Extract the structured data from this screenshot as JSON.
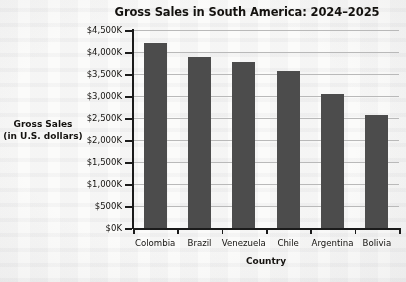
{
  "chart_data": {
    "type": "bar",
    "title": "Gross Sales in South America: 2024–2025",
    "xlabel": "Country",
    "ylabel": "Gross Sales\n(in U.S. dollars)",
    "ylabel_line1": "Gross Sales",
    "ylabel_line2": "(in U.S. dollars)",
    "categories": [
      "Colombia",
      "Brazil",
      "Venezuela",
      "Chile",
      "Argentina",
      "Bolivia"
    ],
    "values": [
      4200,
      3880,
      3770,
      3570,
      3050,
      2560
    ],
    "value_unit": "thousands of U.S. dollars",
    "ylim": [
      0,
      4500
    ],
    "ytick_values": [
      0,
      500,
      1000,
      1500,
      2000,
      2500,
      3000,
      3500,
      4000,
      4500
    ],
    "ytick_labels": [
      "$0K",
      "$500K",
      "$1,000K",
      "$1,500K",
      "$2,000K",
      "$2,500K",
      "$3,000K",
      "$3,500K",
      "$4,000K",
      "$4,500K"
    ],
    "grid": true,
    "legend": null,
    "bar_color": "#4c4c4c",
    "axis_color": "#1b1b1b",
    "gridline_color": "#b9b9b9",
    "background_color": "#fbfbfa"
  }
}
